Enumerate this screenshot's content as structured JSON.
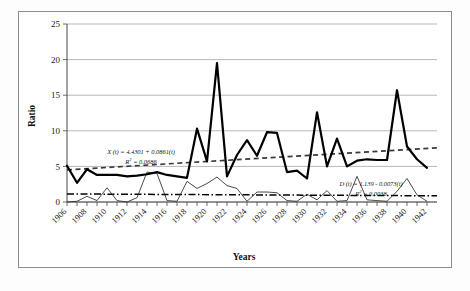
{
  "figure": {
    "background_color": "#ffffff",
    "frame_color": "#8d8d8d"
  },
  "chart_data": {
    "type": "line",
    "title": "",
    "xlabel": "Years",
    "ylabel": "Ratio",
    "xlim": [
      1906,
      1943
    ],
    "ylim": [
      0,
      25
    ],
    "yticks": [
      0,
      5,
      10,
      15,
      20,
      25
    ],
    "grid": true,
    "legend_position": "none",
    "x": [
      1906,
      1907,
      1908,
      1909,
      1910,
      1911,
      1912,
      1913,
      1914,
      1915,
      1916,
      1917,
      1918,
      1919,
      1920,
      1921,
      1922,
      1923,
      1924,
      1925,
      1926,
      1927,
      1928,
      1929,
      1930,
      1931,
      1932,
      1933,
      1934,
      1935,
      1936,
      1937,
      1938,
      1939,
      1940,
      1941,
      1942
    ],
    "xtick_labels": [
      "1906",
      "1908",
      "1910",
      "1912",
      "1914",
      "1916",
      "1918",
      "1920",
      "1922",
      "1924",
      "1926",
      "1928",
      "1930",
      "1932",
      "1934",
      "1936",
      "1938",
      "1940",
      "1942"
    ],
    "xtick_step": 2,
    "series": [
      {
        "name": "X ratio",
        "style": "thick-solid",
        "color": "#000000",
        "values": [
          5.1,
          2.7,
          4.6,
          3.8,
          3.8,
          3.8,
          3.6,
          3.7,
          3.9,
          4.2,
          3.8,
          3.6,
          3.4,
          10.3,
          5.7,
          19.5,
          3.6,
          6.6,
          8.7,
          6.5,
          9.8,
          9.7,
          4.2,
          4.4,
          3.3,
          12.6,
          5.0,
          8.9,
          5.0,
          5.8,
          6.0,
          5.9,
          5.9,
          15.7,
          7.8,
          6.0,
          4.8
        ]
      },
      {
        "name": "D ratio",
        "style": "thin-solid",
        "color": "#2b2b2b",
        "values": [
          0.0,
          0.1,
          0.8,
          0.2,
          2.0,
          0.2,
          0.0,
          0.6,
          4.2,
          4.0,
          0.2,
          0.1,
          2.9,
          1.9,
          2.6,
          3.5,
          2.3,
          1.9,
          0.1,
          1.4,
          1.4,
          1.3,
          0.2,
          0.1,
          1.1,
          0.3,
          1.6,
          0.1,
          0.2,
          3.6,
          0.3,
          0.2,
          0.1,
          1.5,
          3.3,
          1.0,
          0.1
        ]
      }
    ],
    "trendlines": [
      {
        "name": "X trendline",
        "style": "dashed",
        "intercept": 4.4301,
        "slope": 0.0861,
        "r_squared": 0.0686,
        "equation_text": "X (t) = 4.4301 + 0.0861(t)",
        "r2_label": "R",
        "r2_exponent": "2",
        "r2_value_text": " = 0.0686"
      },
      {
        "name": "D trendline",
        "style": "dash-dot",
        "intercept": 1.139,
        "slope": -0.0073,
        "r_squared": 0.0038,
        "equation_text": "D (t) = 1.139 - 0.0073(t)",
        "r2_label": "R",
        "r2_exponent": "2",
        "r2_value_text": " = 0.0038"
      }
    ]
  }
}
